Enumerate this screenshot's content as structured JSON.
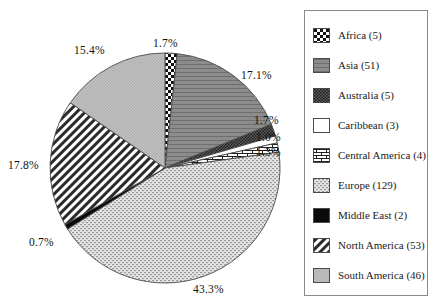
{
  "chart_data": {
    "type": "pie",
    "title": "",
    "categories": [
      "Africa",
      "Asia",
      "Australia",
      "Caribbean",
      "Central America",
      "Europe",
      "Middle East",
      "North America",
      "South America"
    ],
    "counts": [
      5,
      51,
      5,
      3,
      4,
      129,
      2,
      53,
      46
    ],
    "values": [
      1.7,
      17.1,
      1.7,
      1.0,
      1.3,
      43.3,
      0.7,
      17.8,
      15.4
    ],
    "value_labels": [
      "1.7%",
      "17.1%",
      "1.7%",
      "1.0%",
      "1.3%",
      "43.3%",
      "0.7%",
      "17.8%",
      "15.4%"
    ],
    "unit": "%",
    "total_count": 298,
    "start_angle_deg": 0,
    "direction": "clockwise",
    "legend_position": "right",
    "grid": false,
    "xlabel": "",
    "ylabel": "",
    "fills": [
      "checkerboard-bold",
      "horizontal-lines-gray",
      "checkerboard-fine-dark",
      "solid-white",
      "brick",
      "stipple-fine",
      "solid-black",
      "diagonal-hatch",
      "dotted-light-gray"
    ]
  },
  "legend": {
    "items": [
      {
        "label": "Africa (5)",
        "pattern": "checkerboard-bold"
      },
      {
        "label": "Asia (51)",
        "pattern": "horizontal-lines-gray"
      },
      {
        "label": "Australia (5)",
        "pattern": "checkerboard-fine-dark"
      },
      {
        "label": "Caribbean (3)",
        "pattern": "solid-white"
      },
      {
        "label": "Central America (4)",
        "pattern": "brick"
      },
      {
        "label": "Europe (129)",
        "pattern": "stipple-fine"
      },
      {
        "label": "Middle East (2)",
        "pattern": "solid-black"
      },
      {
        "label": "North America (53)",
        "pattern": "diagonal-hatch"
      },
      {
        "label": "South America (46)",
        "pattern": "dotted-light-gray"
      }
    ]
  },
  "pie_labels": [
    {
      "text": "1.7%",
      "name": "africa",
      "left": 153,
      "top": 38
    },
    {
      "text": "17.1%",
      "name": "asia",
      "left": 241,
      "top": 70
    },
    {
      "text": "1.7%",
      "name": "australia",
      "left": 254,
      "top": 115
    },
    {
      "text": "1.0%",
      "name": "caribbean",
      "left": 256,
      "top": 132
    },
    {
      "text": "1.3%",
      "name": "central-america",
      "left": 256,
      "top": 147
    },
    {
      "text": "43.3%",
      "name": "europe",
      "left": 193,
      "top": 284
    },
    {
      "text": "0.7%",
      "name": "middle-east",
      "left": 29,
      "top": 237
    },
    {
      "text": "17.8%",
      "name": "north-america",
      "left": 8,
      "top": 160
    },
    {
      "text": "15.4%",
      "name": "south-america",
      "left": 74,
      "top": 45
    }
  ],
  "colors": {
    "outline": "#4a4a4a",
    "legend_border": "#8a8a8a",
    "text": "#1a1a1a",
    "asia_gray": "#8c8c8c",
    "australia_gray": "#6a6a6a",
    "south_america_gray": "#bdbdbd",
    "europe_gray": "#d2d2d2",
    "middle_east_black": "#0a0a0a"
  }
}
